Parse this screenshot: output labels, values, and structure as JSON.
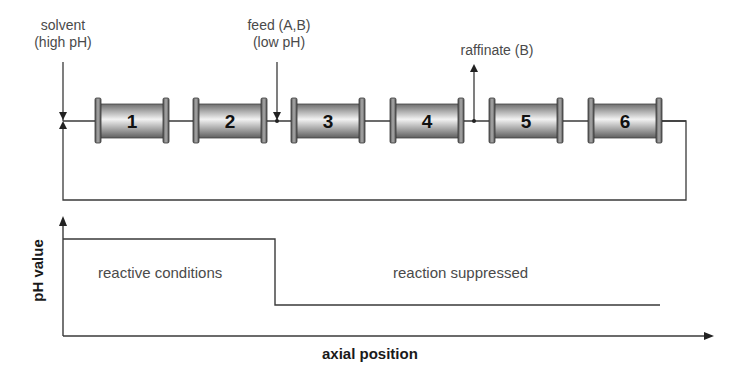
{
  "process": {
    "solvent_label": [
      "solvent",
      "(high pH)"
    ],
    "feed_label": [
      "feed (A,B)",
      "(low pH)"
    ],
    "raffinate_label": "raffinate (B)",
    "columns": [
      {
        "id": "1",
        "x": 95
      },
      {
        "id": "2",
        "x": 193
      },
      {
        "id": "3",
        "x": 291
      },
      {
        "id": "4",
        "x": 390
      },
      {
        "id": "5",
        "x": 489
      },
      {
        "id": "6",
        "x": 588
      }
    ]
  },
  "plot": {
    "ylabel": "pH value",
    "xlabel": "axial position",
    "region_left": "reactive conditions",
    "region_right": "reaction suppressed"
  },
  "chart_data": {
    "type": "line",
    "title": "",
    "xlabel": "axial position",
    "ylabel": "pH value",
    "grid": false,
    "series": [
      {
        "name": "pH profile",
        "x": [
          0,
          0.33,
          0.33,
          0.92
        ],
        "y": [
          "high",
          "high",
          "low",
          "low"
        ]
      }
    ],
    "annotations": [
      "reactive conditions",
      "reaction suppressed"
    ]
  },
  "colors": {
    "line": "#3a3a3a",
    "column_body_dark": "#7a7a7a",
    "column_body_light": "#f0f0f0",
    "text": "#4a4a4a"
  }
}
